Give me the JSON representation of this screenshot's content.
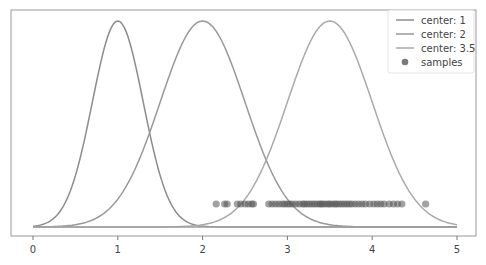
{
  "chart_data": {
    "type": "line",
    "title": "",
    "xlabel": "",
    "ylabel": "",
    "xlim": [
      -0.25,
      5.2
    ],
    "ylim": [
      0,
      1.05
    ],
    "grid": false,
    "legend_position": "upper right",
    "x_ticks": [
      0,
      1,
      2,
      3,
      4,
      5
    ],
    "x_tick_labels": [
      "0",
      "1",
      "2",
      "3",
      "4",
      "5"
    ],
    "series": [
      {
        "name": "center: 1",
        "kind": "line",
        "center": 1,
        "sigma": 0.3,
        "color": "#8c8c8c"
      },
      {
        "name": "center: 2",
        "kind": "line",
        "center": 2,
        "sigma": 0.5,
        "color": "#999999"
      },
      {
        "name": "center: 3.5",
        "kind": "line",
        "center": 3.5,
        "sigma": 0.5,
        "color": "#aaaaaa"
      },
      {
        "name": "samples",
        "kind": "scatter",
        "y": 0.11,
        "color": "#555555",
        "x": [
          2.16,
          2.26,
          2.29,
          2.41,
          2.45,
          2.5,
          2.54,
          2.58,
          2.6,
          2.78,
          2.82,
          2.86,
          2.9,
          2.94,
          2.97,
          3.0,
          3.03,
          3.06,
          3.1,
          3.14,
          3.18,
          3.2,
          3.23,
          3.26,
          3.29,
          3.32,
          3.35,
          3.38,
          3.4,
          3.42,
          3.45,
          3.48,
          3.5,
          3.53,
          3.56,
          3.58,
          3.61,
          3.64,
          3.67,
          3.7,
          3.73,
          3.76,
          3.8,
          3.84,
          3.88,
          3.92,
          3.97,
          4.02,
          4.06,
          4.1,
          4.14,
          4.2,
          4.25,
          4.3,
          4.35,
          4.63
        ]
      }
    ]
  },
  "legend": {
    "items": [
      {
        "label": "center: 1",
        "type": "line",
        "color": "#8c8c8c"
      },
      {
        "label": "center: 2",
        "type": "line",
        "color": "#999999"
      },
      {
        "label": "center: 3.5",
        "type": "line",
        "color": "#aaaaaa"
      },
      {
        "label": "samples",
        "type": "marker",
        "color": "#7a7a7a"
      }
    ]
  }
}
